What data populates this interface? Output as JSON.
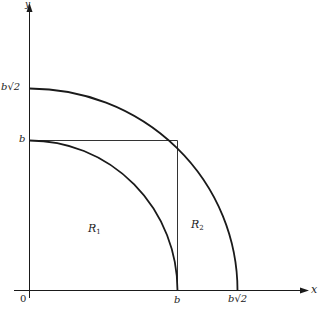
{
  "diagram": {
    "type": "geometry",
    "axes": {
      "x_label": "x",
      "y_label": "y",
      "origin_label": "0"
    },
    "ticks": {
      "x_b": "b",
      "x_b_sqrt2": "b√2",
      "y_b": "b",
      "y_b_sqrt2": "b√2"
    },
    "regions": {
      "r1": {
        "letter": "R",
        "sub": "1"
      },
      "r2": {
        "letter": "R",
        "sub": "2"
      }
    },
    "colors": {
      "stroke": "#1a1a1a",
      "thin_stroke": "#333333",
      "background": "#ffffff"
    }
  }
}
